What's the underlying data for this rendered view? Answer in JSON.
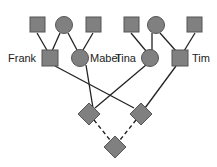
{
  "diagram": {
    "type": "pedigree",
    "colors": {
      "fill": "#808080",
      "stroke": "#555555",
      "line": "#222222",
      "background": "#ffffff"
    },
    "people": [
      {
        "id": "gp1",
        "shape": "square",
        "label": ""
      },
      {
        "id": "gp2",
        "shape": "circle",
        "label": ""
      },
      {
        "id": "gp3",
        "shape": "square",
        "label": ""
      },
      {
        "id": "gp4",
        "shape": "square",
        "label": ""
      },
      {
        "id": "gp5",
        "shape": "circle",
        "label": ""
      },
      {
        "id": "gp6",
        "shape": "square",
        "label": ""
      },
      {
        "id": "frank",
        "shape": "square",
        "label": "Frank"
      },
      {
        "id": "mabel",
        "shape": "circle",
        "label": "Mabel"
      },
      {
        "id": "tina",
        "shape": "circle",
        "label": "Tina"
      },
      {
        "id": "tim",
        "shape": "square",
        "label": "Tim"
      },
      {
        "id": "child1",
        "shape": "diamond",
        "label": ""
      },
      {
        "id": "child2",
        "shape": "diamond",
        "label": ""
      },
      {
        "id": "grandchild",
        "shape": "diamond",
        "label": ""
      }
    ],
    "links": [
      {
        "from": "gp1",
        "to": "frank",
        "style": "solid"
      },
      {
        "from": "gp2",
        "to": "frank",
        "style": "solid"
      },
      {
        "from": "gp2",
        "to": "mabel",
        "style": "solid"
      },
      {
        "from": "gp3",
        "to": "mabel",
        "style": "solid"
      },
      {
        "from": "gp4",
        "to": "tina",
        "style": "solid"
      },
      {
        "from": "gp5",
        "to": "tina",
        "style": "solid"
      },
      {
        "from": "gp5",
        "to": "tim",
        "style": "solid"
      },
      {
        "from": "gp6",
        "to": "tim",
        "style": "solid"
      },
      {
        "from": "frank",
        "to": "child2",
        "style": "solid"
      },
      {
        "from": "tina",
        "to": "child1",
        "style": "solid"
      },
      {
        "from": "mabel",
        "to": "child2",
        "style": "solid"
      },
      {
        "from": "tim",
        "to": "child2",
        "style": "solid"
      },
      {
        "from": "child1",
        "to": "grandchild",
        "style": "dashed"
      },
      {
        "from": "child2",
        "to": "grandchild",
        "style": "dashed"
      }
    ],
    "labels": {
      "frank": "Frank",
      "mabel": "Mabel",
      "tina": "Tina",
      "tim": "Tim"
    }
  }
}
